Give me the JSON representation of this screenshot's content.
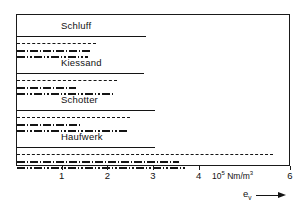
{
  "chart_data": {
    "type": "bar",
    "orientation": "horizontal",
    "title": "",
    "subtitle": "",
    "xlabel": "e_v",
    "ylabel": "",
    "xlim": [
      0,
      6
    ],
    "xticks": [
      1,
      2,
      3,
      4,
      6
    ],
    "xtick_labels": [
      "1",
      "2",
      "3",
      "4",
      "6"
    ],
    "x_unit": "10^5 Nm/m^3",
    "x_unit_display": "Nm/m",
    "x_unit_mantissa": "10",
    "x_unit_exponent": "5",
    "x_unit_cube": "3",
    "axis_var_base": "e",
    "axis_var_sub": "v",
    "grid": false,
    "legend": "none",
    "frame": true,
    "note": "Each material group shows four horizontal range bars, all starting at 0, drawn with distinct line styles (solid, dashed, dash-dot, dash-dot-dot). Values are bar end points in 10^5 Nm/m^3.",
    "categories": [
      "Schluff",
      "Kiessand",
      "Schotter",
      "Haufwerk"
    ],
    "groups": [
      {
        "label": "Schluff",
        "bars": [
          {
            "style": "solid",
            "start": 0,
            "end": 2.82
          },
          {
            "style": "dashed",
            "start": 0,
            "end": 1.72
          },
          {
            "style": "dashdot",
            "start": 0,
            "end": 1.62
          },
          {
            "style": "dashdotdot",
            "start": 0,
            "end": 1.55
          }
        ]
      },
      {
        "label": "Kiessand",
        "bars": [
          {
            "style": "solid",
            "start": 0,
            "end": 2.78
          },
          {
            "style": "dashed",
            "start": 0,
            "end": 2.18
          },
          {
            "style": "dashdot",
            "start": 0,
            "end": 1.3
          },
          {
            "style": "dashdotdot",
            "start": 0,
            "end": 2.12
          }
        ]
      },
      {
        "label": "Schotter",
        "bars": [
          {
            "style": "solid",
            "start": 0,
            "end": 3.02
          },
          {
            "style": "dashed",
            "start": 0,
            "end": 2.48
          },
          {
            "style": "dashdot",
            "start": 0,
            "end": 1.38
          },
          {
            "style": "dashdotdot",
            "start": 0,
            "end": 2.46
          }
        ]
      },
      {
        "label": "Haufwerk",
        "bars": [
          {
            "style": "solid",
            "start": 0,
            "end": 3.02
          },
          {
            "style": "dashed",
            "start": 0,
            "end": 5.6
          },
          {
            "style": "dashdot",
            "start": 0,
            "end": 3.55
          },
          {
            "style": "dashdotdot",
            "start": 0,
            "end": 3.72
          }
        ]
      }
    ]
  }
}
